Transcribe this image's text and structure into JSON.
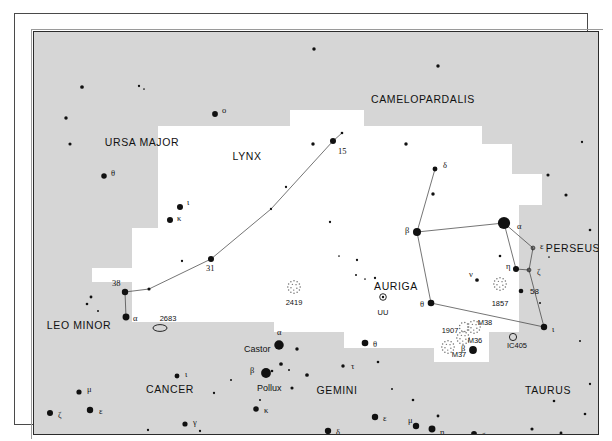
{
  "chart_data": {
    "type": "scatter",
    "xlabel": "",
    "ylabel": "",
    "xlim": [
      0,
      564
    ],
    "ylim": [
      0,
      402
    ],
    "grid": false,
    "legend": "none",
    "projection": "equatorial star map",
    "background_regions": {
      "main_fill": "#d6d6d6",
      "highlight_fill": "#ffffff",
      "note": "white polygon highlights the constellations Lynx and Auriga"
    },
    "constellation_names": [
      {
        "label": "URSA MAJOR",
        "x": 108,
        "y": 110
      },
      {
        "label": "CAMELOPARDALIS",
        "x": 389,
        "y": 67
      },
      {
        "label": "LYNX",
        "x": 213,
        "y": 124
      },
      {
        "label": "AURIGA",
        "x": 362,
        "y": 254
      },
      {
        "label": "PERSEUS",
        "x": 539,
        "y": 216
      },
      {
        "label": "LEO MINOR",
        "x": 45,
        "y": 293
      },
      {
        "label": "CANCER",
        "x": 136,
        "y": 357
      },
      {
        "label": "GEMINI",
        "x": 303,
        "y": 358
      },
      {
        "label": "TAURUS",
        "x": 514,
        "y": 358
      }
    ],
    "stars": [
      {
        "x": 48,
        "y": 55,
        "mag": 2.6,
        "label": ""
      },
      {
        "x": 105,
        "y": 54,
        "mag": 1.6,
        "label": ""
      },
      {
        "x": 110,
        "y": 57,
        "mag": 1.2,
        "label": ""
      },
      {
        "x": 32,
        "y": 86,
        "mag": 2.4,
        "label": ""
      },
      {
        "x": 181,
        "y": 82,
        "mag": 4.0,
        "label": "o",
        "lx": 188,
        "ly": 78
      },
      {
        "x": 36,
        "y": 112,
        "mag": 2.2,
        "label": ""
      },
      {
        "x": 70,
        "y": 144,
        "mag": 3.8,
        "label": "θ",
        "lx": 77,
        "ly": 141
      },
      {
        "x": 146,
        "y": 175,
        "mag": 4.2,
        "label": "ι",
        "lx": 153,
        "ly": 170
      },
      {
        "x": 136,
        "y": 188,
        "mag": 4.2,
        "label": "κ",
        "lx": 143,
        "ly": 186
      },
      {
        "x": 115,
        "y": 257,
        "mag": 2.2,
        "label": ""
      },
      {
        "x": 91,
        "y": 260,
        "mag": 4.4,
        "label": "38",
        "lx": 78,
        "ly": 251
      },
      {
        "x": 92,
        "y": 285,
        "mag": 4.8,
        "label": "α",
        "lx": 99,
        "ly": 286
      },
      {
        "x": 177,
        "y": 227,
        "mag": 4.2,
        "label": "31",
        "lx": 172,
        "ly": 236
      },
      {
        "x": 237,
        "y": 177,
        "mag": 1.6,
        "label": ""
      },
      {
        "x": 299,
        "y": 109,
        "mag": 4.2,
        "label": "15",
        "lx": 304,
        "ly": 119
      },
      {
        "x": 308,
        "y": 101,
        "mag": 1.8,
        "label": ""
      },
      {
        "x": 280,
        "y": 17,
        "mag": 2.4,
        "label": ""
      },
      {
        "x": 404,
        "y": 34,
        "mag": 2.4,
        "label": ""
      },
      {
        "x": 279,
        "y": 112,
        "mag": 2.4,
        "label": ""
      },
      {
        "x": 372,
        "y": 112,
        "mag": 2.4,
        "label": ""
      },
      {
        "x": 399,
        "y": 162,
        "mag": 2.4,
        "label": ""
      },
      {
        "x": 514,
        "y": 143,
        "mag": 2.2,
        "label": ""
      },
      {
        "x": 532,
        "y": 163,
        "mag": 2.2,
        "label": ""
      },
      {
        "x": 401,
        "y": 137,
        "mag": 3.4,
        "label": "δ",
        "lx": 409,
        "ly": 133
      },
      {
        "x": 383,
        "y": 200,
        "mag": 5.6,
        "label": "β",
        "lx": 371,
        "ly": 198
      },
      {
        "x": 470,
        "y": 191,
        "mag": 8.5,
        "label": "α",
        "lx": 483,
        "ly": 194
      },
      {
        "x": 499,
        "y": 216,
        "mag": 3.2,
        "type": "variable",
        "label": "ε",
        "lx": 506,
        "ly": 214
      },
      {
        "x": 482,
        "y": 237,
        "mag": 4.2,
        "label": "η",
        "lx": 472,
        "ly": 234
      },
      {
        "x": 495,
        "y": 238,
        "mag": 3.2,
        "type": "variable",
        "label": "ζ",
        "lx": 503,
        "ly": 240
      },
      {
        "x": 443,
        "y": 248,
        "mag": 2.6,
        "label": "ν",
        "lx": 435,
        "ly": 242
      },
      {
        "x": 397,
        "y": 271,
        "mag": 4.6,
        "label": "θ",
        "lx": 386,
        "ly": 272
      },
      {
        "x": 510,
        "y": 295,
        "mag": 4.4,
        "label": "ι",
        "lx": 518,
        "ly": 297
      },
      {
        "x": 439,
        "y": 318,
        "mag": 5.4,
        "label": "β",
        "lx": 427,
        "ly": 316
      },
      {
        "x": 466,
        "y": 224,
        "mag": 1.8,
        "label": ""
      },
      {
        "x": 323,
        "y": 228,
        "mag": 1.6,
        "label": ""
      },
      {
        "x": 322,
        "y": 243,
        "mag": 1.4,
        "label": ""
      },
      {
        "x": 331,
        "y": 247,
        "mag": 1.2,
        "label": ""
      },
      {
        "x": 341,
        "y": 246,
        "mag": 1.6,
        "label": ""
      },
      {
        "x": 305,
        "y": 224,
        "mag": 1.2,
        "label": ""
      },
      {
        "x": 252,
        "y": 155,
        "mag": 1.6,
        "label": ""
      },
      {
        "x": 296,
        "y": 190,
        "mag": 1.6,
        "label": ""
      },
      {
        "x": 148,
        "y": 229,
        "mag": 1.6,
        "label": ""
      },
      {
        "x": 506,
        "y": 271,
        "mag": 1.4,
        "label": ""
      },
      {
        "x": 515,
        "y": 225,
        "mag": 1.2,
        "label": ""
      },
      {
        "x": 487,
        "y": 259,
        "mag": 3.2,
        "label": "58",
        "lx": 496,
        "ly": 260,
        "sans": true
      },
      {
        "x": 53,
        "y": 272,
        "mag": 1.8,
        "label": ""
      },
      {
        "x": 57,
        "y": 265,
        "mag": 2.0,
        "label": ""
      },
      {
        "x": 64,
        "y": 279,
        "mag": 1.4,
        "label": ""
      },
      {
        "x": 45,
        "y": 360,
        "mag": 3.6,
        "label": "μ",
        "lx": 53,
        "ly": 357
      },
      {
        "x": 56,
        "y": 378,
        "mag": 4.4,
        "label": "ε",
        "lx": 65,
        "ly": 379
      },
      {
        "x": 16,
        "y": 381,
        "mag": 4.2,
        "label": "ζ",
        "lx": 24,
        "ly": 383
      },
      {
        "x": 143,
        "y": 344,
        "mag": 3.4,
        "label": "ι",
        "lx": 151,
        "ly": 342
      },
      {
        "x": 180,
        "y": 361,
        "mag": 1.6,
        "label": ""
      },
      {
        "x": 114,
        "y": 398,
        "mag": 1.6,
        "label": ""
      },
      {
        "x": 151,
        "y": 392,
        "mag": 3.6,
        "label": "γ",
        "lx": 159,
        "ly": 390
      },
      {
        "x": 166,
        "y": 399,
        "mag": 1.6,
        "label": ""
      },
      {
        "x": 245,
        "y": 313,
        "mag": 6.6,
        "label": "α",
        "lx": 243,
        "ly": 300,
        "named": "Castor",
        "nx": 210,
        "ny": 318
      },
      {
        "x": 263,
        "y": 317,
        "mag": 2.4,
        "label": ""
      },
      {
        "x": 232,
        "y": 341,
        "mag": 6.8,
        "label": "β",
        "lx": 216,
        "ly": 338,
        "named": "Pollux",
        "nx": 223,
        "ny": 357
      },
      {
        "x": 247,
        "y": 332,
        "mag": 2.6,
        "label": ""
      },
      {
        "x": 273,
        "y": 343,
        "mag": 2.6,
        "label": ""
      },
      {
        "x": 258,
        "y": 356,
        "mag": 2.2,
        "label": ""
      },
      {
        "x": 255,
        "y": 338,
        "mag": 1.4,
        "label": ""
      },
      {
        "x": 222,
        "y": 377,
        "mag": 3.8,
        "label": "κ",
        "lx": 230,
        "ly": 378
      },
      {
        "x": 331,
        "y": 311,
        "mag": 4.6,
        "label": "θ",
        "lx": 339,
        "ly": 312
      },
      {
        "x": 309,
        "y": 334,
        "mag": 2.4,
        "label": "τ",
        "lx": 317,
        "ly": 334
      },
      {
        "x": 341,
        "y": 385,
        "mag": 4.4,
        "label": "ε",
        "lx": 349,
        "ly": 386
      },
      {
        "x": 294,
        "y": 399,
        "mag": 4.4,
        "label": "δ",
        "lx": 302,
        "ly": 400
      },
      {
        "x": 335,
        "y": 415,
        "mag": 2.6,
        "label": "ζ",
        "lx": 343,
        "ly": 416
      },
      {
        "x": 382,
        "y": 394,
        "mag": 4.4,
        "label": "μ",
        "lx": 374,
        "ly": 388
      },
      {
        "x": 398,
        "y": 397,
        "mag": 4.8,
        "label": "η",
        "lx": 406,
        "ly": 400
      },
      {
        "x": 404,
        "y": 384,
        "mag": 2.0,
        "label": ""
      },
      {
        "x": 440,
        "y": 402,
        "mag": 4.0,
        "label": "ζ",
        "lx": 448,
        "ly": 404
      },
      {
        "x": 352,
        "y": 411,
        "mag": 1.4,
        "label": ""
      },
      {
        "x": 498,
        "y": 397,
        "mag": 2.2,
        "label": ""
      },
      {
        "x": 527,
        "y": 401,
        "mag": 2.0,
        "label": ""
      },
      {
        "x": 238,
        "y": 339,
        "mag": 1.8,
        "label": ""
      },
      {
        "x": 197,
        "y": 348,
        "mag": 1.4,
        "label": ""
      },
      {
        "x": 226,
        "y": 368,
        "mag": 1.4,
        "label": ""
      },
      {
        "x": 344,
        "y": 330,
        "mag": 1.8,
        "label": ""
      },
      {
        "x": 358,
        "y": 357,
        "mag": 1.4,
        "label": ""
      },
      {
        "x": 379,
        "y": 368,
        "mag": 1.8,
        "label": ""
      },
      {
        "x": 520,
        "y": 369,
        "mag": 1.8,
        "label": ""
      },
      {
        "x": 556,
        "y": 352,
        "mag": 1.6,
        "label": ""
      },
      {
        "x": 551,
        "y": 382,
        "mag": 1.8,
        "label": ""
      },
      {
        "x": 548,
        "y": 110,
        "mag": 1.6,
        "label": ""
      },
      {
        "x": 556,
        "y": 198,
        "mag": 1.8,
        "label": ""
      },
      {
        "x": 546,
        "y": 309,
        "mag": 1.4,
        "label": ""
      }
    ],
    "deep_sky_objects": [
      {
        "name": "2683",
        "x": 126,
        "y": 296,
        "type": "galaxy",
        "lx": 134,
        "ly": 287
      },
      {
        "name": "2419",
        "x": 260,
        "y": 255,
        "type": "cluster",
        "lx": 260,
        "ly": 271
      },
      {
        "name": "UU",
        "x": 349,
        "y": 265,
        "type": "variable",
        "lx": 349,
        "ly": 281
      },
      {
        "name": "1857",
        "x": 466,
        "y": 252,
        "type": "cluster",
        "lx": 466,
        "ly": 272
      },
      {
        "name": "M38",
        "x": 440,
        "y": 295,
        "type": "cluster",
        "lx": 451,
        "ly": 291
      },
      {
        "name": "M36",
        "x": 429,
        "y": 306,
        "type": "cluster",
        "lx": 441,
        "ly": 309
      },
      {
        "name": "M37",
        "x": 414,
        "y": 315,
        "type": "cluster",
        "lx": 425,
        "ly": 323
      },
      {
        "name": "1907",
        "x": 430,
        "y": 295,
        "type": "cluster",
        "lx": 416,
        "ly": 299,
        "small": true
      },
      {
        "name": "IC405",
        "x": 479,
        "y": 305,
        "type": "nebula",
        "lx": 483,
        "ly": 314
      }
    ],
    "constellation_lines": [
      {
        "constellation": "Lynx",
        "points": [
          [
            92,
            285
          ],
          [
            91,
            260
          ],
          [
            115,
            257
          ],
          [
            177,
            227
          ],
          [
            237,
            177
          ],
          [
            299,
            109
          ],
          [
            308,
            101
          ]
        ]
      },
      {
        "constellation": "Auriga",
        "points": [
          [
            401,
            137
          ],
          [
            383,
            200
          ],
          [
            470,
            191
          ],
          [
            499,
            216
          ],
          [
            495,
            238
          ],
          [
            482,
            237
          ],
          [
            470,
            191
          ]
        ]
      },
      {
        "constellation": "Auriga",
        "points": [
          [
            383,
            200
          ],
          [
            397,
            271
          ],
          [
            510,
            295
          ],
          [
            495,
            238
          ]
        ]
      },
      {
        "constellation": "Auriga",
        "points": [
          [
            397,
            271
          ],
          [
            510,
            295
          ]
        ]
      }
    ]
  },
  "chart": {
    "alt": "Printed star atlas page showing Auriga, Lynx and neighbouring constellations"
  }
}
